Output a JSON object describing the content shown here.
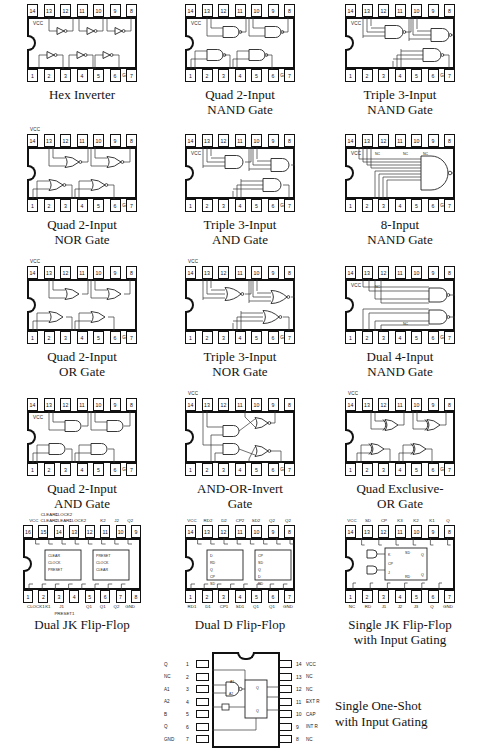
{
  "page": {
    "columns": 3,
    "rows": 5
  },
  "chips": [
    {
      "id": "hex-inverter",
      "caption": [
        "Hex Inverter"
      ],
      "package": "14-pin DIP",
      "pins_top": [
        "14",
        "13",
        "12",
        "11",
        "10",
        "9",
        "8"
      ],
      "pins_bottom": [
        "1",
        "2",
        "3",
        "4",
        "5",
        "6",
        "7"
      ],
      "power_label": "VCC",
      "ground_label": "GND",
      "gate_type": "inverter",
      "gate_count": 6,
      "inner_notes": []
    },
    {
      "id": "quad-2-input-nand",
      "caption": [
        "Quad 2-Input",
        "NAND Gate"
      ],
      "package": "14-pin DIP",
      "pins_top": [
        "14",
        "13",
        "12",
        "11",
        "10",
        "9",
        "8"
      ],
      "pins_bottom": [
        "1",
        "2",
        "3",
        "4",
        "5",
        "6",
        "7"
      ],
      "power_label": "VCC",
      "ground_label": "GND",
      "gate_type": "nand2",
      "gate_count": 4,
      "inner_notes": []
    },
    {
      "id": "triple-3-input-nand",
      "caption": [
        "Triple 3-Input",
        "NAND Gate"
      ],
      "package": "14-pin DIP",
      "pins_top": [
        "14",
        "13",
        "12",
        "11",
        "10",
        "9",
        "8"
      ],
      "pins_bottom": [
        "1",
        "2",
        "3",
        "4",
        "5",
        "6",
        "7"
      ],
      "power_label": "VCC",
      "ground_label": "GND",
      "gate_type": "nand3",
      "gate_count": 3,
      "inner_notes": []
    },
    {
      "id": "quad-2-input-nor",
      "caption": [
        "Quad 2-Input",
        "NOR Gate"
      ],
      "package": "14-pin DIP",
      "pins_top": [
        "14",
        "13",
        "12",
        "11",
        "10",
        "9",
        "8"
      ],
      "pins_bottom": [
        "1",
        "2",
        "3",
        "4",
        "5",
        "6",
        "7"
      ],
      "power_label": "VCC",
      "ground_label": "GND",
      "gate_type": "nor2",
      "gate_count": 4,
      "inner_notes": [],
      "vcc_outside": true
    },
    {
      "id": "triple-3-input-and",
      "caption": [
        "Triple 3-Input",
        "AND Gate"
      ],
      "package": "14-pin DIP",
      "pins_top": [
        "14",
        "13",
        "12",
        "11",
        "10",
        "9",
        "8"
      ],
      "pins_bottom": [
        "1",
        "2",
        "3",
        "4",
        "5",
        "6",
        "7"
      ],
      "power_label": "VCC",
      "ground_label": "GND",
      "gate_type": "and3",
      "gate_count": 3,
      "inner_notes": []
    },
    {
      "id": "8-input-nand",
      "caption": [
        "8-Input",
        "NAND Gate"
      ],
      "package": "14-pin DIP",
      "pins_top": [
        "14",
        "13",
        "12",
        "11",
        "10",
        "9",
        "8"
      ],
      "pins_bottom": [
        "1",
        "2",
        "3",
        "4",
        "5",
        "6",
        "7"
      ],
      "power_label": "VCC",
      "ground_label": "GND",
      "gate_type": "nand8",
      "gate_count": 1,
      "inner_notes": [
        "NC",
        "NC",
        "NC"
      ]
    },
    {
      "id": "quad-2-input-or",
      "caption": [
        "Quad 2-Input",
        "OR Gate"
      ],
      "package": "14-pin DIP",
      "pins_top": [
        "14",
        "13",
        "12",
        "11",
        "10",
        "9",
        "8"
      ],
      "pins_bottom": [
        "1",
        "2",
        "3",
        "4",
        "5",
        "6",
        "7"
      ],
      "power_label": "VCC",
      "ground_label": "GND",
      "gate_type": "or2",
      "gate_count": 4,
      "inner_notes": [],
      "vcc_outside": true
    },
    {
      "id": "triple-3-input-nor",
      "caption": [
        "Triple 3-Input",
        "NOR Gate"
      ],
      "package": "14-pin DIP",
      "pins_top": [
        "14",
        "13",
        "12",
        "11",
        "10",
        "9",
        "8"
      ],
      "pins_bottom": [
        "1",
        "2",
        "3",
        "4",
        "5",
        "6",
        "7"
      ],
      "power_label": "VCC",
      "ground_label": "GND",
      "gate_type": "nor3",
      "gate_count": 3,
      "inner_notes": [],
      "vcc_outside": true
    },
    {
      "id": "dual-4-input-nand",
      "caption": [
        "Dual 4-Input",
        "NAND Gate"
      ],
      "package": "14-pin DIP",
      "pins_top": [
        "14",
        "13",
        "12",
        "11",
        "10",
        "9",
        "8"
      ],
      "pins_bottom": [
        "1",
        "2",
        "3",
        "4",
        "5",
        "6",
        "7"
      ],
      "power_label": "VCC",
      "ground_label": "GND",
      "gate_type": "nand4",
      "gate_count": 2,
      "inner_notes": [
        "NC",
        "NC"
      ]
    },
    {
      "id": "quad-2-input-and",
      "caption": [
        "Quad 2-Input",
        "AND Gate"
      ],
      "package": "14-pin DIP",
      "pins_top": [
        "14",
        "13",
        "12",
        "11",
        "10",
        "9",
        "8"
      ],
      "pins_bottom": [
        "1",
        "2",
        "3",
        "4",
        "5",
        "6",
        "7"
      ],
      "power_label": "VCC",
      "ground_label": "GND",
      "gate_type": "and2",
      "gate_count": 4,
      "inner_notes": []
    },
    {
      "id": "and-or-invert",
      "caption": [
        "AND-OR-Invert",
        "Gate"
      ],
      "package": "14-pin DIP",
      "pins_top": [
        "14",
        "13",
        "12",
        "11",
        "10",
        "9",
        "8"
      ],
      "pins_bottom": [
        "1",
        "2",
        "3",
        "4",
        "5",
        "6",
        "7"
      ],
      "power_label": "VCC",
      "ground_label": "GND",
      "gate_type": "aoi",
      "gate_count": 2,
      "inner_notes": [],
      "vcc_outside": true
    },
    {
      "id": "quad-exclusive-or",
      "caption": [
        "Quad Exclusive-",
        "OR Gate"
      ],
      "package": "14-pin DIP",
      "pins_top": [
        "14",
        "13",
        "12",
        "11",
        "10",
        "9",
        "8"
      ],
      "pins_bottom": [
        "1",
        "2",
        "3",
        "4",
        "5",
        "6",
        "7"
      ],
      "power_label": "VCC",
      "ground_label": "GND",
      "gate_type": "xor2",
      "gate_count": 4,
      "inner_notes": [],
      "vcc_outside": true
    },
    {
      "id": "dual-jk-flip-flop",
      "caption": [
        "Dual JK Flip-Flop"
      ],
      "package": "16-pin DIP",
      "pins_top": [
        "16",
        "15",
        "14",
        "13",
        "12",
        "11",
        "10",
        "9"
      ],
      "pins_bottom": [
        "1",
        "2",
        "3",
        "4",
        "5",
        "6",
        "7",
        "8"
      ],
      "power_label": "VCC",
      "ground_label": "GND",
      "gate_type": "jkff2",
      "gate_count": 2,
      "sig_top": [
        "VCC",
        "CLEAR2",
        "CLEAR1",
        "CLOCK2",
        "",
        "K2",
        "J2",
        "Q2"
      ],
      "sig_top_upper": [
        "",
        "CLEAR1",
        "CLOCK2",
        "",
        "",
        "",
        "",
        ""
      ],
      "sig_bottom": [
        "CLOCK1",
        "K1",
        "J1",
        "",
        "Q1",
        "Q1",
        "Q2",
        "GND"
      ],
      "sig_bottom_sub": [
        "",
        "",
        "PRESET1",
        "",
        "",
        "",
        "",
        ""
      ],
      "block_labels": [
        "CLEAR",
        "CLOCK",
        "PRESET",
        "PRESET",
        "CLOCK",
        "CLEAR"
      ],
      "inner_notes": []
    },
    {
      "id": "dual-d-flip-flop",
      "caption": [
        "Dual D Flip-Flop"
      ],
      "package": "14-pin DIP",
      "pins_top": [
        "14",
        "13",
        "12",
        "11",
        "10",
        "9",
        "8"
      ],
      "pins_bottom": [
        "1",
        "2",
        "3",
        "4",
        "5",
        "6",
        "7"
      ],
      "power_label": "VCC",
      "ground_label": "GND",
      "gate_type": "dff2",
      "gate_count": 2,
      "sig_top": [
        "VCC",
        "RD2",
        "D2",
        "CP2",
        "SD2",
        "Q2",
        "Q2"
      ],
      "sig_bottom": [
        "RD1",
        "D1",
        "CP1",
        "SD1",
        "Q1",
        "Q1",
        "GND"
      ],
      "block_labels": [
        "D",
        "RD",
        "Q",
        "CP",
        "SD",
        "Q",
        "CP",
        "SD",
        "Q",
        "D",
        "RD",
        "Q"
      ],
      "inner_notes": []
    },
    {
      "id": "single-jk-flip-flop-input-gating",
      "caption": [
        "Single JK Flip-Flop",
        "with Input Gating"
      ],
      "package": "14-pin DIP",
      "pins_top": [
        "14",
        "13",
        "12",
        "11",
        "10",
        "9",
        "8"
      ],
      "pins_bottom": [
        "1",
        "2",
        "3",
        "4",
        "5",
        "6",
        "7"
      ],
      "power_label": "VCC",
      "ground_label": "GND",
      "gate_type": "jkff1",
      "gate_count": 1,
      "sig_top": [
        "VCC",
        "SD",
        "CP",
        "K3",
        "K2",
        "K1",
        "Q"
      ],
      "sig_bottom": [
        "NC",
        "RD",
        "J1",
        "J2",
        "J3",
        "Q",
        "GND"
      ],
      "block_labels": [
        "K",
        "SD",
        "Q",
        "CP",
        "J",
        "RD",
        "Q"
      ],
      "inner_notes": []
    }
  ],
  "one_shot": {
    "id": "single-one-shot-input-gating",
    "caption": [
      "Single One-Shot",
      "with Input Gating"
    ],
    "package": "14-pin DIP",
    "left_pins": [
      {
        "num": "1",
        "label": "Q"
      },
      {
        "num": "2",
        "label": "NC"
      },
      {
        "num": "3",
        "label": "A1"
      },
      {
        "num": "4",
        "label": "A2"
      },
      {
        "num": "5",
        "label": "B"
      },
      {
        "num": "6",
        "label": "Q"
      },
      {
        "num": "7",
        "label": "GND"
      }
    ],
    "right_pins": [
      {
        "num": "14",
        "label": "VCC"
      },
      {
        "num": "13",
        "label": "NC"
      },
      {
        "num": "12",
        "label": "NC"
      },
      {
        "num": "11",
        "label": "EXT R"
      },
      {
        "num": "10",
        "label": "CAP"
      },
      {
        "num": "9",
        "label": "INT R"
      },
      {
        "num": "8",
        "label": "NC"
      }
    ],
    "block_labels": [
      "Q",
      "Q"
    ]
  },
  "style": {
    "ink": "#111111",
    "wire": "#333333",
    "paper": "#ffffff"
  }
}
